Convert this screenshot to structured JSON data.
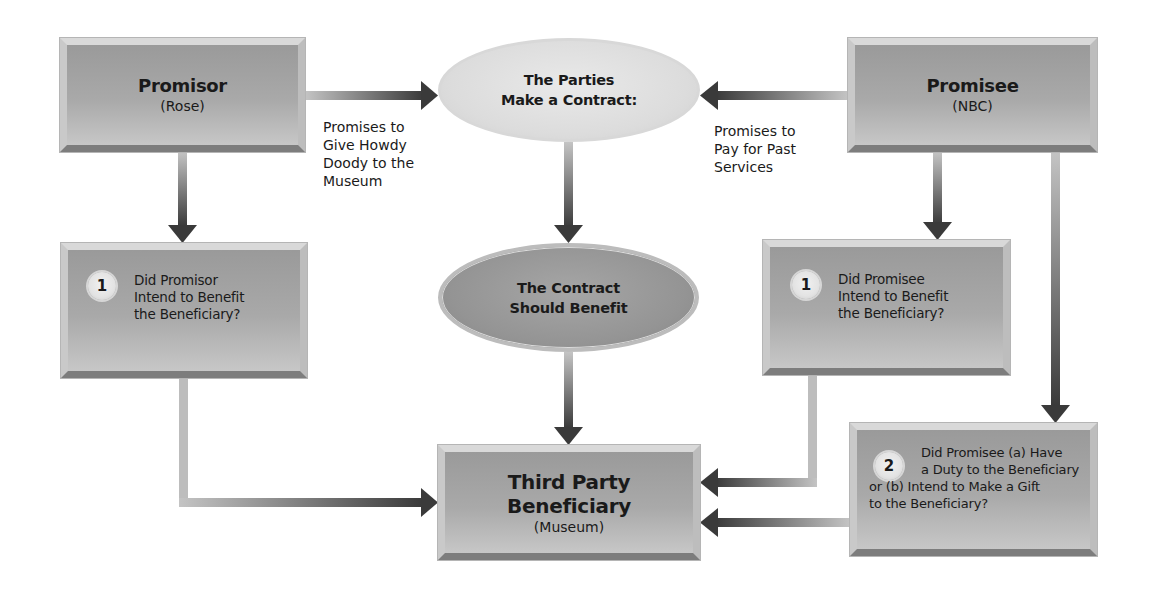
{
  "diagram": {
    "promisor": {
      "title": "Promisor",
      "subtitle": "(Rose)"
    },
    "promisee": {
      "title": "Promisee",
      "subtitle": "(NBC)"
    },
    "contract_ellipse": {
      "line1": "The Parties",
      "line2": "Make a Contract:"
    },
    "benefit_ellipse": {
      "line1": "The Contract",
      "line2": "Should Benefit"
    },
    "beneficiary": {
      "line1": "Third Party",
      "line2": "Beneficiary",
      "subtitle": "(Museum)"
    },
    "promisor_promise_label": [
      "Promises to",
      "Give Howdy",
      "Doody to the",
      "Museum"
    ],
    "promisee_promise_label": [
      "Promises to",
      "Pay for Past",
      "Services"
    ],
    "promisor_question": {
      "number": "1",
      "lines": [
        "Did Promisor",
        "Intend to Benefit",
        "the Beneficiary?"
      ]
    },
    "promisee_question_1": {
      "number": "1",
      "lines": [
        "Did Promisee",
        "Intend to Benefit",
        "the Beneficiary?"
      ]
    },
    "promisee_question_2": {
      "number": "2",
      "lines": [
        "Did Promisee (a) Have",
        "a Duty to the Beneficiary",
        "or (b) Intend to Make a Gift",
        "to the Beneficiary?"
      ]
    },
    "colors": {
      "box_fill": "#a9a9a9",
      "ellipse_light": "#dcdcdc",
      "ellipse_dark": "#949494",
      "arrow_dark": "#3a3a3a",
      "arrow_light": "#bdbdbd"
    }
  }
}
